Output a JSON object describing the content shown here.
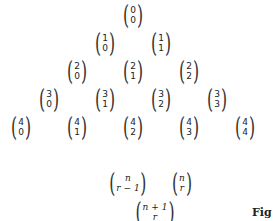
{
  "triangle": {
    "rows": [
      [
        {
          "n": "0",
          "k": "0"
        }
      ],
      [
        {
          "n": "1",
          "k": "0"
        },
        {
          "n": "1",
          "k": "1"
        }
      ],
      [
        {
          "n": "2",
          "k": "0"
        },
        {
          "n": "2",
          "k": "1"
        },
        {
          "n": "2",
          "k": "2"
        }
      ],
      [
        {
          "n": "3",
          "k": "0"
        },
        {
          "n": "3",
          "k": "1"
        },
        {
          "n": "3",
          "k": "2"
        },
        {
          "n": "3",
          "k": "3"
        }
      ],
      [
        {
          "n": "4",
          "k": "0"
        },
        {
          "n": "4",
          "k": "1"
        },
        {
          "n": "4",
          "k": "2"
        },
        {
          "n": "4",
          "k": "3"
        },
        {
          "n": "4",
          "k": "4"
        }
      ]
    ]
  },
  "identity": {
    "left": {
      "top": "n",
      "bottom": "r − 1"
    },
    "right": {
      "top": "n",
      "bottom": "r"
    },
    "sum": {
      "top": "n + 1",
      "bottom": "r"
    }
  },
  "caption": "Fig"
}
